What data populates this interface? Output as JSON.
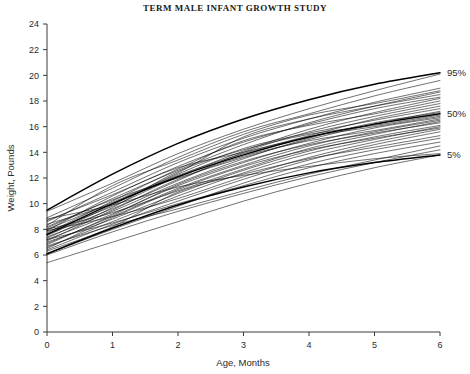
{
  "chart_data": {
    "type": "line",
    "title": "TERM MALE INFANT GROWTH STUDY",
    "xlabel": "Age, Months",
    "ylabel": "Weight, Pounds",
    "xlim": [
      0,
      6
    ],
    "ylim": [
      0,
      24
    ],
    "x_ticks": [
      0,
      1,
      2,
      3,
      4,
      5,
      6
    ],
    "y_ticks": [
      0,
      2,
      4,
      6,
      8,
      10,
      12,
      14,
      16,
      18,
      20,
      22,
      24
    ],
    "grid": false,
    "legend_position": "right-inline-annotations",
    "x": [
      0,
      1,
      2,
      3,
      4,
      5,
      6
    ],
    "annotations": [
      {
        "label": "95%",
        "x": 6,
        "y": 20.2
      },
      {
        "label": "50%",
        "x": 6,
        "y": 17.0
      },
      {
        "label": "5%",
        "x": 6,
        "y": 13.8
      }
    ],
    "reference_series": [
      {
        "name": "95%",
        "values": [
          9.5,
          12.3,
          14.7,
          16.6,
          18.1,
          19.3,
          20.2
        ]
      },
      {
        "name": "50%",
        "values": [
          7.6,
          10.0,
          12.1,
          13.8,
          15.2,
          16.2,
          17.0
        ]
      },
      {
        "name": "5%",
        "values": [
          6.1,
          8.1,
          9.9,
          11.3,
          12.4,
          13.2,
          13.8
        ]
      }
    ],
    "series": [
      {
        "name": "subject-01",
        "values": [
          9.4,
          11.6,
          13.9,
          15.8,
          17.4,
          18.8,
          20.1
        ]
      },
      {
        "name": "subject-02",
        "values": [
          8.9,
          11.2,
          13.6,
          15.6,
          17.0,
          18.4,
          19.6
        ]
      },
      {
        "name": "subject-03",
        "values": [
          8.6,
          10.9,
          13.2,
          15.1,
          16.6,
          17.9,
          19.0
        ]
      },
      {
        "name": "subject-04",
        "values": [
          8.3,
          11.4,
          13.4,
          15.4,
          16.9,
          17.8,
          18.8
        ]
      },
      {
        "name": "subject-05",
        "values": [
          8.1,
          10.4,
          12.6,
          14.6,
          16.3,
          17.6,
          18.7
        ]
      },
      {
        "name": "subject-06",
        "values": [
          8.0,
          10.1,
          12.4,
          15.2,
          16.6,
          17.6,
          18.5
        ]
      },
      {
        "name": "subject-07",
        "values": [
          7.9,
          10.6,
          12.9,
          14.8,
          16.2,
          17.4,
          18.3
        ]
      },
      {
        "name": "subject-08",
        "values": [
          7.8,
          9.8,
          12.1,
          14.1,
          15.8,
          17.1,
          18.2
        ]
      },
      {
        "name": "subject-09",
        "values": [
          7.7,
          10.2,
          12.7,
          14.9,
          16.1,
          17.0,
          18.0
        ]
      },
      {
        "name": "subject-10",
        "values": [
          7.6,
          9.6,
          11.8,
          14.0,
          15.6,
          16.8,
          17.8
        ]
      },
      {
        "name": "subject-11",
        "values": [
          8.4,
          10.0,
          12.2,
          13.9,
          15.3,
          16.6,
          17.6
        ]
      },
      {
        "name": "subject-12",
        "values": [
          7.5,
          9.9,
          12.3,
          14.3,
          15.5,
          16.5,
          17.4
        ]
      },
      {
        "name": "subject-13",
        "values": [
          8.2,
          10.3,
          12.0,
          13.6,
          15.0,
          16.2,
          17.2
        ]
      },
      {
        "name": "subject-14",
        "values": [
          7.4,
          9.4,
          11.6,
          13.5,
          15.1,
          16.3,
          17.1
        ]
      },
      {
        "name": "subject-15",
        "values": [
          7.3,
          9.7,
          12.5,
          14.2,
          15.4,
          16.1,
          16.9
        ]
      },
      {
        "name": "subject-16",
        "values": [
          8.7,
          10.7,
          12.8,
          14.0,
          15.2,
          16.0,
          16.8
        ]
      },
      {
        "name": "subject-17",
        "values": [
          7.2,
          9.2,
          11.4,
          13.2,
          14.7,
          15.9,
          16.7
        ]
      },
      {
        "name": "subject-18",
        "values": [
          7.1,
          9.5,
          11.9,
          13.7,
          14.9,
          15.7,
          16.6
        ]
      },
      {
        "name": "subject-19",
        "values": [
          6.9,
          9.0,
          11.2,
          13.0,
          14.5,
          15.6,
          16.5
        ]
      },
      {
        "name": "subject-20",
        "values": [
          8.0,
          9.3,
          11.0,
          12.7,
          14.3,
          15.4,
          16.4
        ]
      },
      {
        "name": "subject-21",
        "values": [
          6.8,
          9.1,
          11.5,
          13.3,
          14.6,
          15.5,
          16.3
        ]
      },
      {
        "name": "subject-22",
        "values": [
          7.0,
          8.8,
          10.8,
          12.6,
          14.1,
          15.2,
          16.1
        ]
      },
      {
        "name": "subject-23",
        "values": [
          6.6,
          8.6,
          10.6,
          12.4,
          13.9,
          15.0,
          16.0
        ]
      },
      {
        "name": "subject-24",
        "values": [
          6.5,
          8.9,
          11.1,
          12.9,
          14.2,
          15.1,
          15.9
        ]
      },
      {
        "name": "subject-25",
        "values": [
          7.9,
          9.0,
          10.4,
          12.1,
          13.6,
          14.8,
          15.8
        ]
      },
      {
        "name": "subject-26",
        "values": [
          6.4,
          8.4,
          10.2,
          11.9,
          13.4,
          14.6,
          15.6
        ]
      },
      {
        "name": "subject-27",
        "values": [
          6.3,
          8.2,
          10.9,
          12.3,
          13.5,
          14.4,
          15.3
        ]
      },
      {
        "name": "subject-28",
        "values": [
          6.1,
          8.0,
          9.8,
          11.6,
          13.1,
          14.2,
          15.1
        ]
      },
      {
        "name": "subject-29",
        "values": [
          7.2,
          8.5,
          10.0,
          11.4,
          12.8,
          13.9,
          14.8
        ]
      },
      {
        "name": "subject-30",
        "values": [
          6.7,
          8.3,
          9.6,
          11.0,
          12.3,
          13.4,
          14.5
        ]
      },
      {
        "name": "subject-31",
        "values": [
          6.0,
          7.8,
          9.4,
          10.8,
          12.1,
          13.2,
          14.2
        ]
      },
      {
        "name": "subject-32",
        "values": [
          8.8,
          9.9,
          11.3,
          12.2,
          12.9,
          13.5,
          13.9
        ]
      },
      {
        "name": "subject-33",
        "values": [
          5.4,
          7.0,
          8.6,
          10.2,
          11.6,
          12.8,
          13.8
        ]
      }
    ]
  }
}
